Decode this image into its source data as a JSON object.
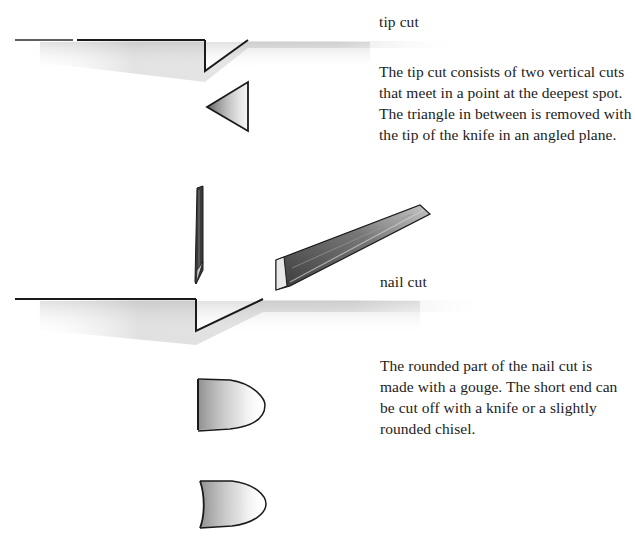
{
  "page": {
    "type": "illustrated instruction page (wood carving cuts)"
  },
  "sections": [
    {
      "id": "tip-cut",
      "heading": "tip cut",
      "description_lines": [
        "The tip cut consists of two vertical cuts",
        "that meet in a point at the deepest spot.",
        "The triangle in between is removed with",
        "the tip of the knife in an angled plane."
      ],
      "illustrations": [
        "wood-surface-profile-with-v-notch",
        "triangle-chip-removed"
      ]
    },
    {
      "id": "nail-cut",
      "heading": "nail cut",
      "description_lines": [
        "The rounded part of the nail cut is",
        "made with a gouge. The short end can",
        "be cut off with a knife or a slightly",
        "rounded chisel."
      ],
      "illustrations": [
        "vertical-knife-blade",
        "angled-chisel",
        "wood-surface-profile-with-notch",
        "nail-shape-straight-end",
        "nail-shape-concave-end"
      ]
    }
  ],
  "colors": {
    "ink": "#1a1a1a",
    "shading": "#9a9a9a",
    "paper": "#ffffff"
  }
}
